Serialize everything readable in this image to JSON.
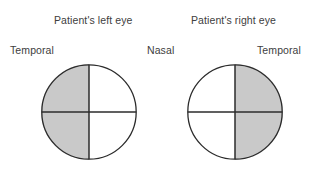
{
  "diagram": {
    "type": "visual-field-chart",
    "background_color": "#ffffff",
    "shaded_color": "#c9c9c9",
    "unshaded_color": "#ffffff",
    "outline_color": "#2b2b2b",
    "text_color": "#404040",
    "titles": {
      "left_eye": "Patient's left eye",
      "right_eye": "Patient's right eye"
    },
    "orientation_labels": {
      "outer_left": "Temporal",
      "center": "Nasal",
      "outer_right": "Temporal"
    },
    "eyes": [
      {
        "id": "left-eye",
        "title": "Patient's left eye",
        "quadrants": {
          "upper_outer": "shaded",
          "lower_outer": "shaded",
          "upper_inner": "clear",
          "lower_inner": "clear"
        }
      },
      {
        "id": "right-eye",
        "title": "Patient's right eye",
        "quadrants": {
          "upper_outer": "shaded",
          "lower_outer": "shaded",
          "upper_inner": "clear",
          "lower_inner": "clear"
        }
      }
    ]
  }
}
